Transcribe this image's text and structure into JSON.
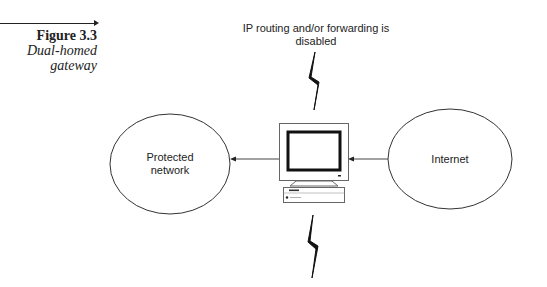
{
  "caption": {
    "figure_number": "Figure 3.3",
    "title_line1": "Dual-homed",
    "title_line2": "gateway"
  },
  "diagram": {
    "top_annotation_line1": "IP routing and/or forwarding is",
    "top_annotation_line2": "disabled",
    "left_node": {
      "label_line1": "Protected",
      "label_line2": "network",
      "shape": "ellipse"
    },
    "right_node": {
      "label_line1": "Internet",
      "shape": "ellipse"
    },
    "center_node": {
      "type": "computer-icon",
      "role": "dual-homed-gateway"
    },
    "connectors": [
      {
        "from": "center_node",
        "to": "left_node",
        "arrow_head": "left_node"
      },
      {
        "from": "right_node",
        "to": "center_node",
        "arrow_head": "center_node"
      }
    ],
    "break_symbols": [
      {
        "name": "lightning-bolt-top",
        "position": "above-computer"
      },
      {
        "name": "lightning-bolt-bottom",
        "position": "below-computer"
      }
    ],
    "colors": {
      "stroke": "#222222",
      "background": "#ffffff"
    }
  }
}
